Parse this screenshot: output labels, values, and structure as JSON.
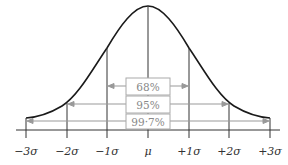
{
  "diagram": {
    "title": "",
    "type": "normal-distribution",
    "axis_labels": [
      "−3σ",
      "−2σ",
      "−1σ",
      "μ",
      "+1σ",
      "+2σ",
      "+3σ"
    ],
    "intervals": [
      {
        "label": "68%",
        "range": "−1σ to +1σ"
      },
      {
        "label": "95%",
        "range": "−2σ to +2σ"
      },
      {
        "label": "99·7%",
        "range": "−3σ to +3σ"
      }
    ],
    "colors": {
      "curve": "#1a1a1a",
      "lines": "#333333",
      "arrows": "#999999",
      "box_border": "#999999",
      "box_text": "#888888"
    }
  }
}
